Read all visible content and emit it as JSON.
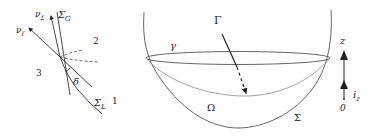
{
  "left_figure": {
    "labels": {
      "nu_sigma": "ν",
      "nu_sigma_sub": "Σ",
      "sigma_g": "Σ",
      "sigma_g_sub": "G",
      "nu_gamma": "ν",
      "nu_gamma_sub": "Γ",
      "region_2": "2",
      "region_3": "3",
      "region_1": "1",
      "delta": "δ",
      "sigma_l": "Σ",
      "sigma_l_sub": "L"
    }
  },
  "right_figure": {
    "labels": {
      "gamma_upper": "Γ",
      "gamma_lower": "γ",
      "omega": "Ω",
      "sigma": "Σ"
    }
  },
  "axis": {
    "z_label": "z",
    "unit_vector": "i",
    "unit_vector_sub": "z",
    "origin": "0"
  },
  "colors": {
    "stroke": "#333333",
    "light_stroke": "#999999"
  }
}
